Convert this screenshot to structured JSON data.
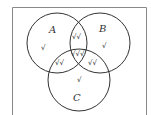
{
  "diagram": {
    "type": "venn",
    "sets": [
      {
        "name": "A",
        "label": "A",
        "only_mark": "√"
      },
      {
        "name": "B",
        "label": "B",
        "only_mark": "√"
      },
      {
        "name": "C",
        "label": "C",
        "only_mark": "√"
      }
    ],
    "regions": {
      "A_only": "√",
      "B_only": "√",
      "C_only": "√",
      "A_and_B_only": "√√",
      "A_and_C_only": "√√",
      "B_and_C_only": "√√",
      "A_and_B_and_C": "√√√"
    },
    "colors": {
      "stroke": "#333333",
      "frame": "#888888",
      "background": "#ffffff"
    }
  }
}
